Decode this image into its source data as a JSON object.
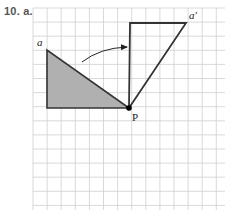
{
  "problem": {
    "label": "10. a."
  },
  "grid": {
    "x0": 33,
    "y0": 8,
    "spacing": 14.1,
    "cols": 14,
    "rows": 15,
    "line_color": "#cfcfcf"
  },
  "original_triangle": {
    "vertices": [
      [
        47,
        50
      ],
      [
        47,
        108
      ],
      [
        129,
        108
      ]
    ],
    "fill": "#b0b0b0",
    "stroke": "#333333"
  },
  "rotated_triangle": {
    "vertices": [
      [
        130,
        23
      ],
      [
        186,
        23
      ],
      [
        129,
        108
      ]
    ],
    "fill": "none",
    "stroke": "#333333"
  },
  "labels": {
    "a": "a",
    "a_prime": "a′",
    "P": "P"
  },
  "rotation_arrow": {
    "from": [
      82,
      62
    ],
    "to": [
      127,
      47
    ],
    "direction": "clockwise"
  },
  "center_point": {
    "name": "P",
    "x": 129,
    "y": 108,
    "color": "#000000"
  }
}
